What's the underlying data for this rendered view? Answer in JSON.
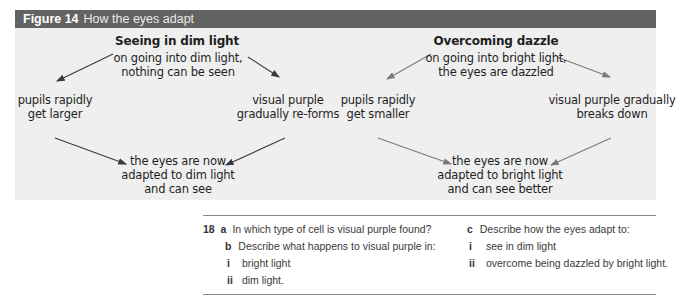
{
  "figure": {
    "number": "Figure 14",
    "caption": "How the eyes adapt",
    "colors": {
      "bar": "#636363",
      "panel": "#efefef",
      "arrow_left": "#3a3a3a",
      "arrow_right": "#7a7a7a"
    },
    "left_diagram": {
      "heading": "Seeing in dim light",
      "top_line1": "on going into dim light,",
      "top_line2": "nothing can be seen",
      "left_line1": "pupils rapidly",
      "left_line2": "get larger",
      "right_line1": "visual purple",
      "right_line2": "gradually re-forms",
      "bottom_line1": "the eyes are now",
      "bottom_line2": "adapted to dim light",
      "bottom_line3": "and can see"
    },
    "right_diagram": {
      "heading": "Overcoming dazzle",
      "top_line1": "on going into bright light,",
      "top_line2": "the eyes are dazzled",
      "left_line1": "pupils rapidly",
      "left_line2": "get smaller",
      "right_line1": "visual purple gradually",
      "right_line2": "breaks down",
      "bottom_line1": "the eyes are now",
      "bottom_line2": "adapted to bright light",
      "bottom_line3": "and can see better"
    }
  },
  "questions": {
    "number": "18",
    "a": {
      "label": "a",
      "text": "In which type of cell is visual purple found?"
    },
    "b": {
      "label": "b",
      "text": "Describe what happens to visual purple in:",
      "i": {
        "label": "i",
        "text": "bright light"
      },
      "ii": {
        "label": "ii",
        "text": "dim light."
      }
    },
    "c": {
      "label": "c",
      "text": "Describe how the eyes adapt to:",
      "i": {
        "label": "i",
        "text": "see in dim light"
      },
      "ii": {
        "label": "ii",
        "text": "overcome being dazzled by bright light."
      }
    }
  }
}
